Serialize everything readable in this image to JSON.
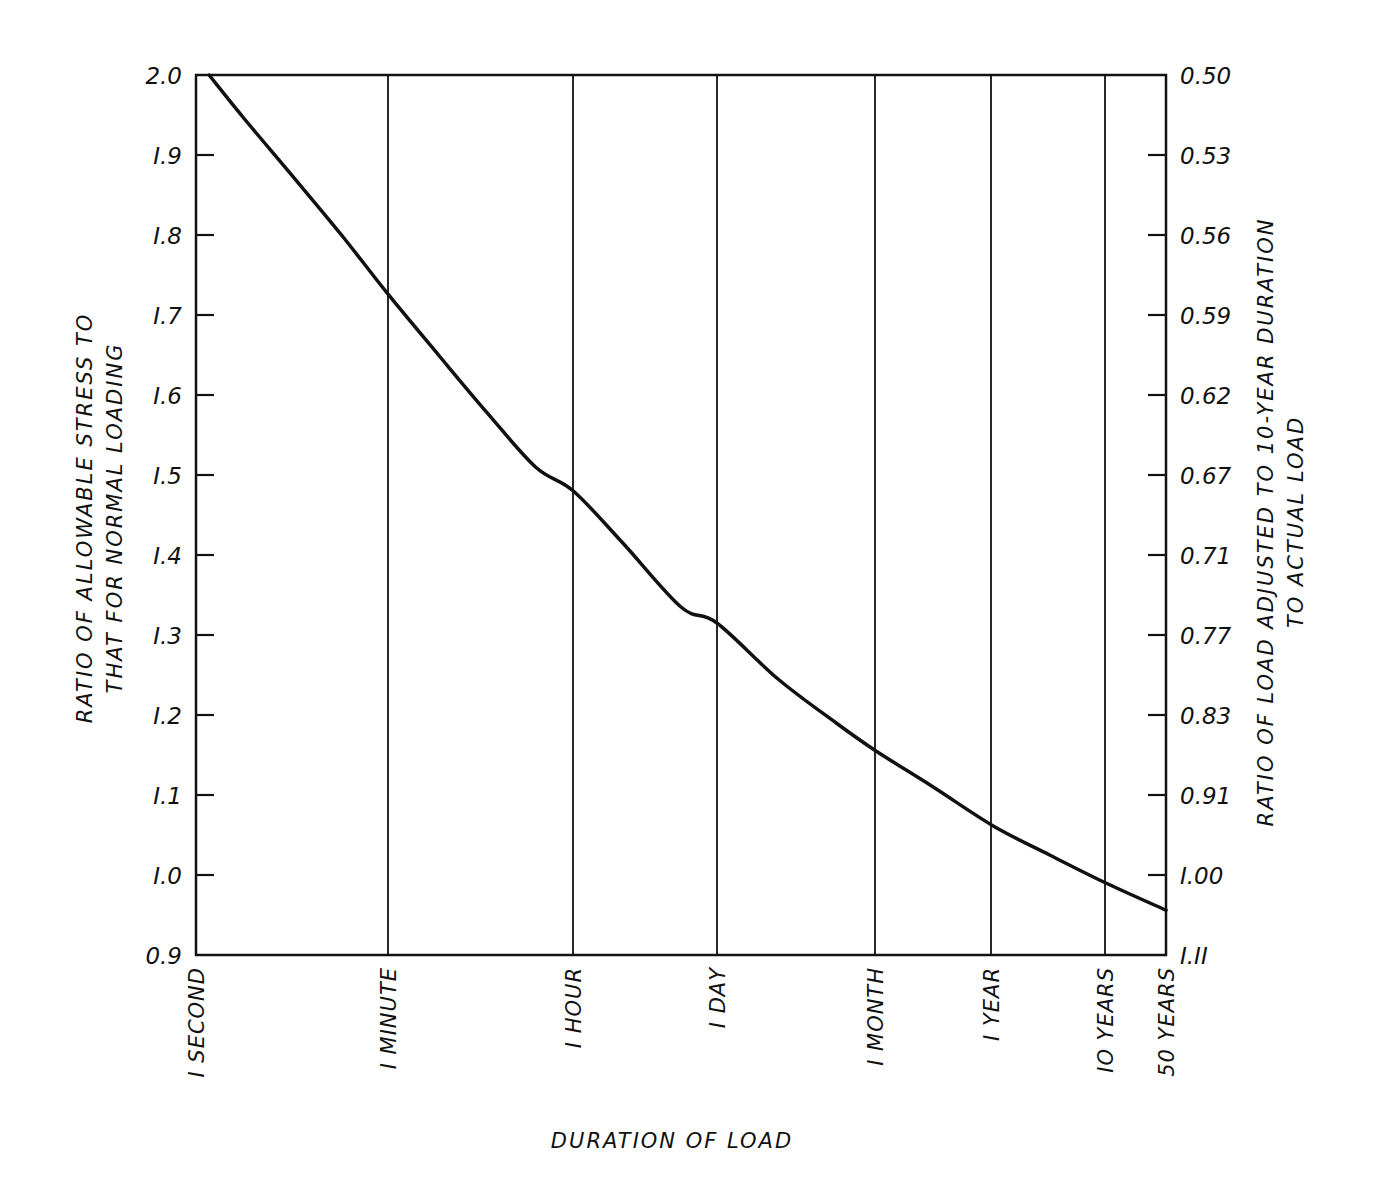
{
  "chart_data": {
    "type": "line",
    "title": "",
    "xlabel": "DURATION OF LOAD",
    "ylabel": "RATIO OF ALLOWABLE STRESS TO THAT FOR NORMAL LOADING",
    "ylabel_lines": [
      "RATIO OF ALLOWABLE STRESS TO",
      "THAT FOR NORMAL LOADING"
    ],
    "y2label": "RATIO OF LOAD ADJUSTED TO 10-YEAR DURATION TO ACTUAL LOAD",
    "y2label_lines": [
      "RATIO OF LOAD ADJUSTED TO 10-YEAR DURATION",
      "TO ACTUAL LOAD"
    ],
    "x_scale": "logarithmic (duration)",
    "categories": [
      "1 SECOND",
      "1 MINUTE",
      "1 HOUR",
      "1 DAY",
      "1 MONTH",
      "1 YEAR",
      "10 YEARS",
      "50 YEARS"
    ],
    "x_tick_labels": [
      "I SECOND",
      "I MINUTE",
      "I HOUR",
      "I DAY",
      "I MONTH",
      "I YEAR",
      "IO YEARS",
      "50 YEARS"
    ],
    "ylim": [
      0.9,
      2.0
    ],
    "y_ticks": [
      "2.0",
      "1.9",
      "1.8",
      "1.7",
      "1.6",
      "1.5",
      "1.4",
      "1.3",
      "1.2",
      "1.1",
      "1.0",
      "0.9"
    ],
    "y_tick_labels": [
      "2.0",
      "I.9",
      "I.8",
      "I.7",
      "I.6",
      "I.5",
      "I.4",
      "I.3",
      "I.2",
      "I.1",
      "I.0",
      "0.9"
    ],
    "y2_ticks": [
      "0.50",
      "0.53",
      "0.56",
      "0.59",
      "0.62",
      "0.67",
      "0.71",
      "0.77",
      "0.83",
      "0.91",
      "1.00",
      "1.11"
    ],
    "y2_tick_labels": [
      "0.50",
      "0.53",
      "0.56",
      "0.59",
      "0.62",
      "0.67",
      "0.71",
      "0.77",
      "0.83",
      "0.91",
      "I.00",
      "I.II"
    ],
    "grid": "vertical lines at each duration category",
    "legend": "none",
    "series": [
      {
        "name": "Duration of load factor",
        "values": [
          2.0,
          1.73,
          1.48,
          1.32,
          1.155,
          1.06,
          0.99,
          0.955
        ]
      }
    ],
    "curve_points": [
      {
        "x": 0.0135,
        "y": 2.0
      },
      {
        "x": 0.05,
        "y": 1.945
      },
      {
        "x": 0.1,
        "y": 1.873
      },
      {
        "x": 0.15,
        "y": 1.8
      },
      {
        "x": 0.198,
        "y": 1.726
      },
      {
        "x": 0.25,
        "y": 1.65
      },
      {
        "x": 0.3,
        "y": 1.578
      },
      {
        "x": 0.35,
        "y": 1.51
      },
      {
        "x": 0.389,
        "y": 1.48
      },
      {
        "x": 0.44,
        "y": 1.415
      },
      {
        "x": 0.5,
        "y": 1.335
      },
      {
        "x": 0.537,
        "y": 1.315
      },
      {
        "x": 0.6,
        "y": 1.245
      },
      {
        "x": 0.66,
        "y": 1.19
      },
      {
        "x": 0.701,
        "y": 1.155
      },
      {
        "x": 0.76,
        "y": 1.11
      },
      {
        "x": 0.821,
        "y": 1.062
      },
      {
        "x": 0.88,
        "y": 1.025
      },
      {
        "x": 0.938,
        "y": 0.99
      },
      {
        "x": 1.0,
        "y": 0.956
      }
    ]
  },
  "layout": {
    "plot_left": 196,
    "plot_right": 1166,
    "plot_top": 75,
    "plot_bottom": 955,
    "category_x": [
      196,
      388,
      573,
      717,
      875,
      991,
      1105,
      1166
    ],
    "line_color": "#111111",
    "background": "#ffffff"
  }
}
